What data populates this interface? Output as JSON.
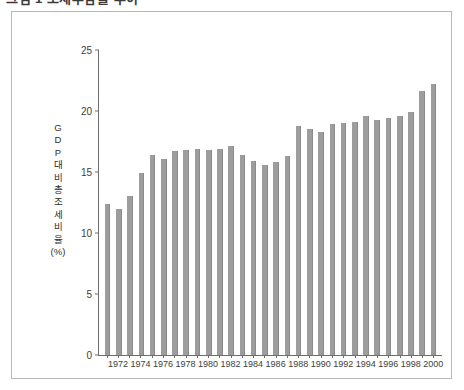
{
  "title": {
    "marker": "square-bullet",
    "text": "그림 1  조세부담률 추이"
  },
  "axes": {
    "y_label_chars": [
      "G",
      "D",
      "P",
      "대",
      "비",
      "총",
      "조",
      "세",
      "비",
      "율",
      "(%)"
    ],
    "y_ticks": [
      0,
      5,
      10,
      15,
      20,
      25
    ],
    "y_min": 0,
    "y_max": 25,
    "x_labels": [
      "1972",
      "1974",
      "1976",
      "1978",
      "1980",
      "1982",
      "1984",
      "1986",
      "1988",
      "1990",
      "1992",
      "1994",
      "1996",
      "1998",
      "2000"
    ]
  },
  "colors": {
    "bar": "#9d9d9d",
    "axis": "#6e6e6e",
    "frame": "#b8b8b8",
    "text": "#3d3d3d",
    "background": "#ffffff"
  },
  "chart_data": {
    "type": "bar",
    "title": "그림 1  조세부담률 추이",
    "xlabel": "",
    "ylabel": "GDP 대비 총조세 비율(%)",
    "ylim": [
      0,
      25
    ],
    "grid": false,
    "legend": "none",
    "categories": [
      "1971",
      "1972",
      "1973",
      "1974",
      "1975",
      "1976",
      "1977",
      "1978",
      "1979",
      "1980",
      "1981",
      "1982",
      "1983",
      "1984",
      "1985",
      "1986",
      "1987",
      "1988",
      "1989",
      "1990",
      "1991",
      "1992",
      "1993",
      "1994",
      "1995",
      "1996",
      "1997",
      "1998",
      "1999",
      "2000"
    ],
    "tick_labels_shown": [
      "1972",
      "1974",
      "1976",
      "1978",
      "1980",
      "1982",
      "1984",
      "1986",
      "1988",
      "1990",
      "1992",
      "1994",
      "1996",
      "1998",
      "2000"
    ],
    "values": [
      12.4,
      12.0,
      13.0,
      14.9,
      16.4,
      16.1,
      16.7,
      16.8,
      16.9,
      16.8,
      16.9,
      17.1,
      16.4,
      15.9,
      15.6,
      15.8,
      16.3,
      18.8,
      18.5,
      18.3,
      18.9,
      19.0,
      19.1,
      19.6,
      19.3,
      19.4,
      19.6,
      19.9,
      21.6,
      22.2
    ]
  }
}
